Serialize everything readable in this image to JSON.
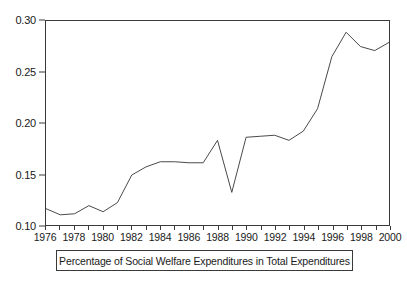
{
  "chart_data": {
    "type": "line",
    "title": "",
    "caption": "Percentage of Social Welfare Expenditures in Total Expenditures",
    "xlabel": "",
    "ylabel": "",
    "xlim": [
      1976,
      2000
    ],
    "ylim": [
      0.1,
      0.3
    ],
    "grid": false,
    "legend": false,
    "line_color": "#4a4a4a",
    "axis_color": "#3a3a3a",
    "x": [
      1976,
      1977,
      1978,
      1979,
      1980,
      1981,
      1982,
      1983,
      1984,
      1985,
      1986,
      1987,
      1988,
      1989,
      1990,
      1991,
      1992,
      1993,
      1994,
      1995,
      1996,
      1997,
      1998,
      1999,
      2000
    ],
    "values": [
      0.116,
      0.11,
      0.111,
      0.119,
      0.113,
      0.122,
      0.149,
      0.157,
      0.162,
      0.162,
      0.161,
      0.161,
      0.183,
      0.132,
      0.186,
      0.187,
      0.188,
      0.183,
      0.192,
      0.214,
      0.265,
      0.289,
      0.275,
      0.271,
      0.279
    ],
    "series": [
      {
        "name": "Percentage of Social Welfare Expenditures in Total Expenditures",
        "values": [
          0.116,
          0.11,
          0.111,
          0.119,
          0.113,
          0.122,
          0.149,
          0.157,
          0.162,
          0.162,
          0.161,
          0.161,
          0.183,
          0.132,
          0.186,
          0.187,
          0.188,
          0.183,
          0.192,
          0.214,
          0.265,
          0.289,
          0.275,
          0.271,
          0.279
        ]
      }
    ],
    "y_ticks": [
      0.1,
      0.15,
      0.2,
      0.25,
      0.3
    ],
    "y_tick_labels": [
      "0.10",
      "0.15",
      "0.20",
      "0.25",
      "0.30"
    ],
    "x_major_ticks": [
      1976,
      1978,
      1980,
      1982,
      1984,
      1986,
      1988,
      1990,
      1992,
      1994,
      1996,
      1998,
      2000
    ],
    "x_major_tick_labels": [
      "1976",
      "1978",
      "1980",
      "1982",
      "1984",
      "1986",
      "1988",
      "1990",
      "1992",
      "1994",
      "1996",
      "1998",
      "2000"
    ],
    "x_minor_ticks": [
      1976,
      1977,
      1978,
      1979,
      1980,
      1981,
      1982,
      1983,
      1984,
      1985,
      1986,
      1987,
      1988,
      1989,
      1990,
      1991,
      1992,
      1993,
      1994,
      1995,
      1996,
      1997,
      1998,
      1999,
      2000
    ]
  }
}
